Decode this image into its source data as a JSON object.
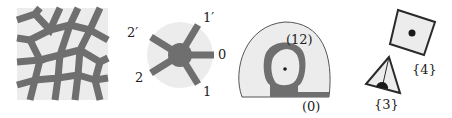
{
  "colors": {
    "light_fill": "#ececec",
    "band": "#6f6f6f",
    "outline": "#2a2a2a",
    "dot": "#1a1a1a"
  },
  "panels": [
    {
      "id": "tiling",
      "description": "Quasi-periodic tiling with gray edges"
    },
    {
      "id": "star",
      "labels": {
        "a": "1′",
        "b": "0",
        "c": "1",
        "d": "2",
        "e": "2′"
      }
    },
    {
      "id": "region",
      "labels": {
        "top": "(12)",
        "bottom": "(0)"
      }
    },
    {
      "id": "polygons",
      "labels": {
        "square": "{4}",
        "triangle": "{3}"
      }
    }
  ]
}
